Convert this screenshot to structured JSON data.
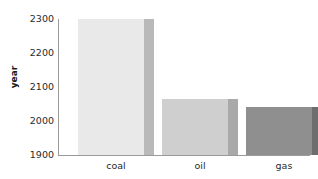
{
  "chart_data": {
    "type": "bar",
    "title": "",
    "xlabel": "",
    "ylabel": "year",
    "categories": [
      "coal",
      "oil",
      "gas"
    ],
    "values": [
      2300,
      2065,
      2040
    ],
    "ylim": [
      1900,
      2300
    ],
    "yticks": [
      1900,
      2000,
      2100,
      2200,
      2300
    ],
    "ytick_labels": [
      "1900",
      "2000",
      "2100",
      "2200",
      "2300"
    ],
    "grid": false,
    "legend": null,
    "bar_colors": [
      "#e9e9e9",
      "#cfcfcf",
      "#8f8f8f"
    ],
    "bar_side_colors": [
      "#b9b9b9",
      "#a9a9a9",
      "#6e6e6e"
    ],
    "axis_color": "#9a9a9a",
    "background": "#ffffff",
    "text_color": "#2a2a2a"
  }
}
